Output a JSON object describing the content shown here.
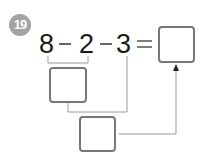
{
  "problem": {
    "number": "19",
    "expression": {
      "terms": [
        "8",
        "2",
        "3"
      ],
      "operators": [
        "−",
        "−"
      ],
      "equals": "="
    },
    "answer_boxes": {
      "first_step": "",
      "second_step": "",
      "final": ""
    }
  },
  "colors": {
    "badge": "#a3a3a3",
    "box_border": "#777777",
    "line": "#888888"
  }
}
